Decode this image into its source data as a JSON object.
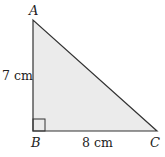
{
  "diagram": {
    "type": "right-triangle",
    "fill_color": "#ebebeb",
    "stroke_color": "#333333",
    "vertices": {
      "A": {
        "label": "A"
      },
      "B": {
        "label": "B",
        "right_angle": true
      },
      "C": {
        "label": "C"
      }
    },
    "sides": {
      "AB": {
        "label": "7 cm"
      },
      "BC": {
        "label": "8 cm"
      }
    }
  }
}
